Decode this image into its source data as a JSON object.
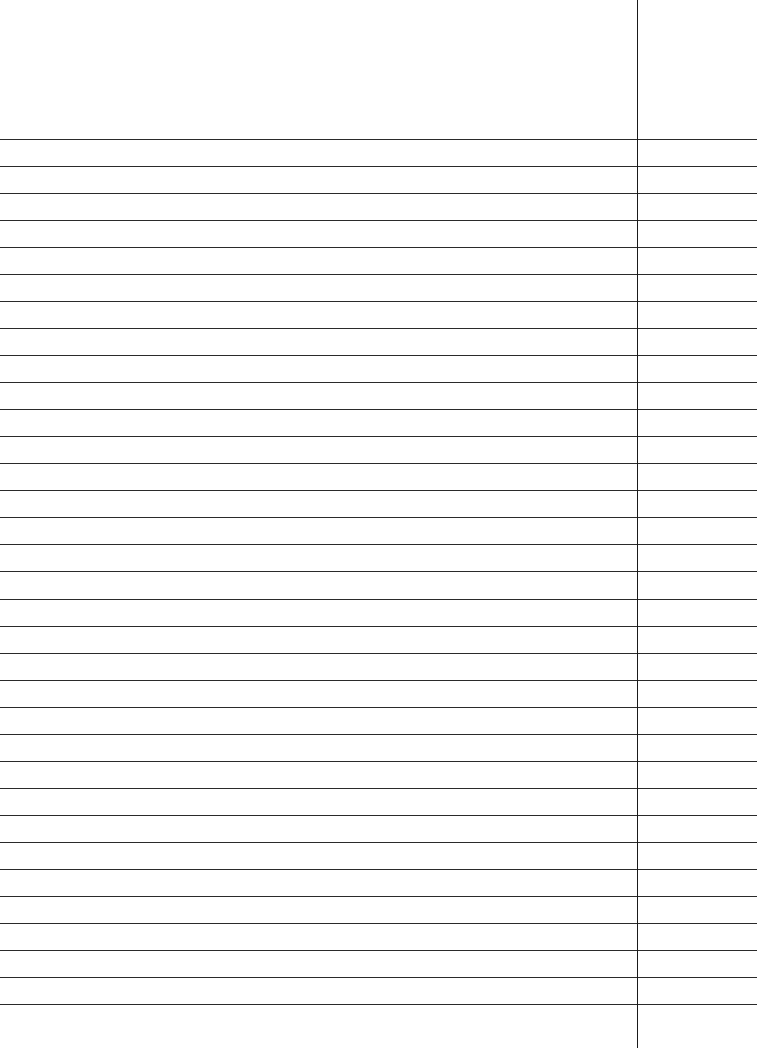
{
  "paper": {
    "background": "#ffffff",
    "line_color": "#2a2a2a",
    "margin_line_color": "#1a1a1a",
    "first_line_y": 139,
    "line_spacing": 27.03,
    "line_count": 33,
    "line_width": 757,
    "margin_x": 637,
    "margin_top": 0,
    "margin_bottom": 1048
  }
}
